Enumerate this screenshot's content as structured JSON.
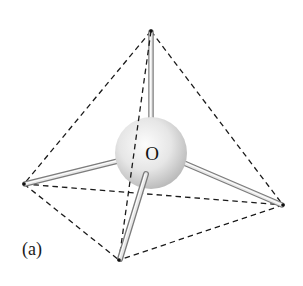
{
  "figure": {
    "panel_label": "(a)",
    "central_atom": {
      "label": "O",
      "cx": 151,
      "cy": 153,
      "r": 36
    },
    "vertices": [
      {
        "name": "top",
        "x": 151,
        "y": 31
      },
      {
        "name": "left",
        "x": 24,
        "y": 184
      },
      {
        "name": "right",
        "x": 283,
        "y": 205
      },
      {
        "name": "bottom",
        "x": 119,
        "y": 260
      }
    ],
    "colors": {
      "edge": "#1a1a1a",
      "bond_light": "#f2f2f2",
      "bond_dark": "#8a8a8a",
      "sphere_light": "#fafafa",
      "sphere_dark": "#bdbdbd",
      "background": "#ffffff"
    }
  }
}
